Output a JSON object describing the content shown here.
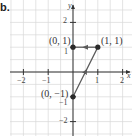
{
  "part_label": "b.",
  "chart_data": {
    "type": "line",
    "title": "",
    "xlabel": "x",
    "ylabel": "y",
    "xlim": [
      -2.9,
      2.4
    ],
    "ylim": [
      -2.6,
      2.9
    ],
    "grid": true,
    "grid_step": 0.5,
    "x_ticks": [
      -2,
      -1,
      1,
      2
    ],
    "x_tick_labels": [
      "−2",
      "−1",
      "1",
      "2"
    ],
    "y_ticks": [
      -2,
      -1,
      1,
      2
    ],
    "y_tick_labels": [
      "−2",
      "−1",
      "1",
      "2"
    ],
    "points": [
      {
        "x": 0,
        "y": -1,
        "label": "(0, −1)"
      },
      {
        "x": 1,
        "y": 1,
        "label": "(1, 1)"
      },
      {
        "x": 0,
        "y": 1,
        "label": "(0, 1)"
      }
    ],
    "path": [
      {
        "from": [
          0,
          -1
        ],
        "to": [
          1,
          1
        ],
        "arrow": "forward"
      },
      {
        "from": [
          1,
          1
        ],
        "to": [
          0,
          1
        ],
        "arrow": "forward"
      }
    ],
    "colors": {
      "grid": "#d8d8d8",
      "axis": "#333333",
      "path": "#5a5a5a",
      "point": "#2a2a2a"
    }
  }
}
